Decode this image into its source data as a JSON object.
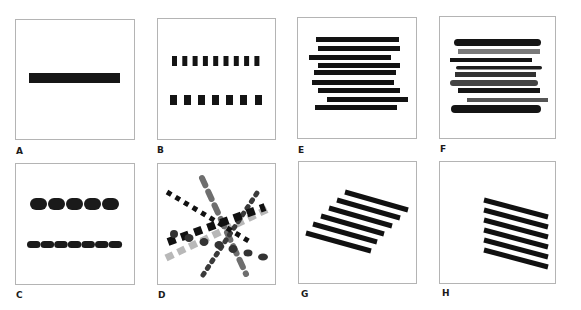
{
  "figure": {
    "panels": [
      {
        "id": "A",
        "label": "A",
        "description": "single continuous horizontal bar"
      },
      {
        "id": "B",
        "label": "B",
        "description": "two rows of square dashes (9 small, 7 larger)"
      },
      {
        "id": "C",
        "label": "C",
        "description": "two rows of rounded pill dashes (5 large, 7 small)"
      },
      {
        "id": "D",
        "label": "D",
        "description": "crossing dashed/dotted lines in varied gray tones"
      },
      {
        "id": "E",
        "label": "E",
        "description": "nine staggered horizontal black bars"
      },
      {
        "id": "F",
        "label": "F",
        "description": "nine staggered horizontal bars varying thickness, tone, and end rounding"
      },
      {
        "id": "G",
        "label": "G",
        "description": "six parallel diagonal bars, staggered leftward"
      },
      {
        "id": "H",
        "label": "H",
        "description": "six parallel diagonal bars, aligned left edge"
      }
    ]
  },
  "colors": {
    "border": "#b4b4b4",
    "black": "#111111",
    "dark_gray": "#3a3a3a",
    "mid_gray": "#6e6e6e",
    "light_gray": "#b8b8b8"
  }
}
